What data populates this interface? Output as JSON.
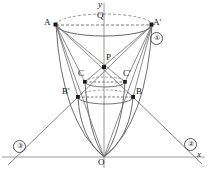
{
  "figure": {
    "background": "#ffffff",
    "line_color": "#777777",
    "dash_color": "#8a8a8a",
    "marker_color": "#1a1a1a",
    "axis_color": "#999999"
  },
  "axes": {
    "x_label": "x",
    "y_label": "y",
    "x_axis_y": 157,
    "y_axis_x": 104,
    "x_label_pos": [
      198,
      152
    ],
    "y_label_pos": [
      98,
      1
    ]
  },
  "points": [
    {
      "id": "A",
      "label": "A",
      "x": 56,
      "y": 25,
      "label_x": 44,
      "label_y": 19,
      "marker": true
    },
    {
      "id": "Ap",
      "label": "A'",
      "x": 152,
      "y": 25,
      "label_x": 153,
      "label_y": 19,
      "marker": true
    },
    {
      "id": "Q",
      "label": "Q",
      "x": 104,
      "y": 25,
      "label_x": 97,
      "label_y": 12,
      "marker": false
    },
    {
      "id": "P",
      "label": "P",
      "x": 104,
      "y": 67,
      "label_x": 106,
      "label_y": 54,
      "marker": true
    },
    {
      "id": "C",
      "label": "C",
      "x": 85,
      "y": 82,
      "label_x": 78,
      "label_y": 70,
      "marker": true
    },
    {
      "id": "Cp",
      "label": "C'",
      "x": 125,
      "y": 82,
      "label_x": 124,
      "label_y": 70,
      "marker": true
    },
    {
      "id": "Bp",
      "label": "B'",
      "x": 78,
      "y": 97,
      "label_x": 63,
      "label_y": 88,
      "marker": true
    },
    {
      "id": "B",
      "label": "B",
      "x": 133,
      "y": 97,
      "label_x": 136,
      "label_y": 88,
      "marker": true
    },
    {
      "id": "O",
      "label": "O",
      "x": 104,
      "y": 157,
      "label_x": 99,
      "label_y": 160,
      "marker": false
    }
  ],
  "circled_numbers": [
    {
      "id": "one",
      "label": "①",
      "x": 150,
      "y": 32
    },
    {
      "id": "two",
      "label": "②",
      "x": 184,
      "y": 138
    },
    {
      "id": "three",
      "label": "③",
      "x": 13,
      "y": 140
    }
  ],
  "ellipses": [
    {
      "id": "top",
      "cx": 104,
      "cy": 25,
      "rx": 48,
      "ry": 11,
      "note": "through A and A', dashed upper arc"
    },
    {
      "id": "middle",
      "cx": 105,
      "cy": 82,
      "rx": 20,
      "ry": 5,
      "note": "through C and C'"
    },
    {
      "id": "bottom",
      "cx": 105.5,
      "cy": 97,
      "rx": 27.5,
      "ry": 7,
      "note": "through B' and B"
    }
  ],
  "chords": [
    {
      "from": "A",
      "to": "Ap",
      "style": "dashed"
    },
    {
      "from": "C",
      "to": "Cp",
      "style": "dashed"
    },
    {
      "from": "Bp",
      "to": "B",
      "style": "dashed"
    }
  ],
  "segments": [
    {
      "from": "A",
      "to": "B"
    },
    {
      "from": "A",
      "to": "Cp"
    },
    {
      "from": "A",
      "to": "Bp"
    },
    {
      "from": "A",
      "to": "C"
    },
    {
      "from": "A",
      "to": "O"
    },
    {
      "from": "Ap",
      "to": "Bp"
    },
    {
      "from": "Ap",
      "to": "C"
    },
    {
      "from": "Ap",
      "to": "B"
    },
    {
      "from": "Ap",
      "to": "Cp"
    },
    {
      "from": "Ap",
      "to": "O"
    },
    {
      "from": "Bp",
      "to": "three-ray"
    },
    {
      "from": "B",
      "to": "two-ray"
    }
  ],
  "curves": [
    {
      "id": "left-outer",
      "note": "parabola A to O"
    },
    {
      "id": "right-outer",
      "note": "parabola A' to O"
    },
    {
      "id": "left-inner",
      "note": "parabola B' to O"
    },
    {
      "id": "right-inner",
      "note": "parabola B to O"
    }
  ]
}
